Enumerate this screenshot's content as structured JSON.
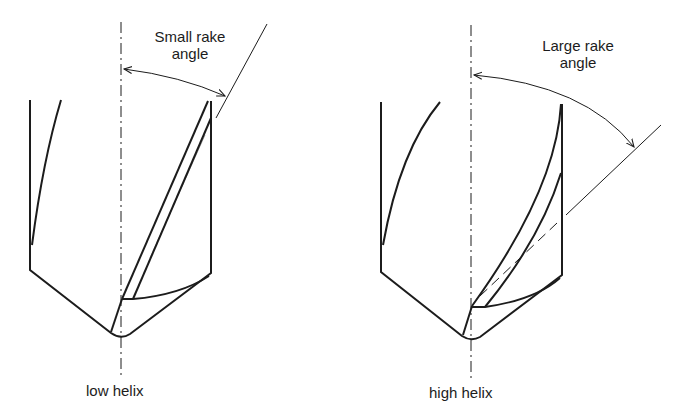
{
  "figure": {
    "panels": [
      {
        "id": "low-helix",
        "caption": "low helix",
        "annotation_line1": "Small rake",
        "annotation_line2": "angle"
      },
      {
        "id": "high-helix",
        "caption": "high helix",
        "annotation_line1": "Large rake",
        "annotation_line2": "angle"
      }
    ],
    "colors": {
      "ink": "#1c1c1c",
      "background": "#ffffff"
    }
  }
}
